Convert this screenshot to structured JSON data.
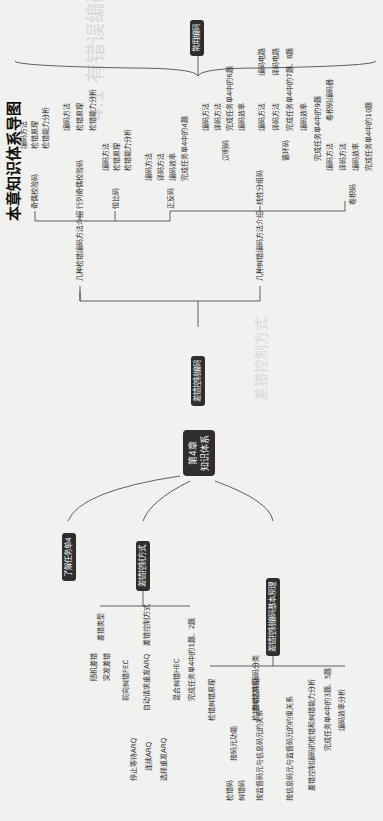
{
  "page": {
    "heading": "本章知识体系导图",
    "orientation": "rotated-90-ccw"
  },
  "mindmap": {
    "center": {
      "line1": "第4章",
      "line2": "知识体系"
    },
    "branches": [
      {
        "label": "了解任务单4"
      },
      {
        "label": "差错控制方式",
        "children": [
          {
            "label": "差错类型",
            "children": [
              {
                "label": "随机差错"
              },
              {
                "label": "突发差错"
              }
            ]
          },
          {
            "label": "差错控制方式",
            "children": [
              {
                "label": "前向纠错FEC"
              },
              {
                "label": "自动请求重发ARQ",
                "children": [
                  {
                    "label": "停止等待ARQ"
                  },
                  {
                    "label": "连续ARQ"
                  },
                  {
                    "label": "选择重发ARQ"
                  }
                ]
              },
              {
                "label": "混合纠错HEC"
              }
            ]
          },
          {
            "label": "完成任务单4中的1题、2题"
          }
        ]
      },
      {
        "label": "差错控制编码基本原理",
        "children": [
          {
            "label": "检错纠错原理"
          },
          {
            "label": "差错控制编码分类",
            "children": [
              {
                "label": "按码元功能",
                "children": [
                  {
                    "label": "检错码"
                  },
                  {
                    "label": "纠错码"
                  }
                ]
              },
              {
                "label": "按监督码元与信息码元的关系",
                "children": [
                  {
                    "label": "线性码"
                  },
                  {
                    "label": "非线性码"
                  }
                ]
              },
              {
                "label": "按信息码元与监督码元的约束关系",
                "children": [
                  {
                    "label": "分组码"
                  },
                  {
                    "label": "卷积码"
                  }
                ]
              }
            ]
          },
          {
            "label": "差错控制编码的检错和纠错能力分析"
          },
          {
            "label": "完成任务单4中的3题、5题"
          },
          {
            "label": "编码效率分析"
          }
        ]
      },
      {
        "label": "差错控制编码",
        "children": [
          {
            "label": "几种检错编码方法介绍",
            "children": [
              {
                "label": "奇偶校验码",
                "children": [
                  {
                    "label": "编码方法"
                  },
                  {
                    "label": "检错原理"
                  },
                  {
                    "label": "检错能力分析"
                  }
                ]
              },
              {
                "label": "行列奇偶校验码",
                "children": [
                  {
                    "label": "编码方法"
                  },
                  {
                    "label": "检错原理"
                  },
                  {
                    "label": "检错能力分析"
                  }
                ]
              },
              {
                "label": "恒比码",
                "children": [
                  {
                    "label": "编码方法"
                  },
                  {
                    "label": "检错原理"
                  },
                  {
                    "label": "检错能力分析"
                  }
                ]
              },
              {
                "label": "正反码",
                "children": [
                  {
                    "label": "编码方法"
                  },
                  {
                    "label": "译码方法"
                  },
                  {
                    "label": "编码效率"
                  },
                  {
                    "label": "完成任务单4中的4题"
                  }
                ]
              }
            ]
          },
          {
            "label": "几种纠错编码方法介绍",
            "children": [
              {
                "label": "线性分组码",
                "children": [
                  {
                    "label": "汉明码",
                    "children": [
                      {
                        "label": "编码方法"
                      },
                      {
                        "label": "译码方法"
                      },
                      {
                        "label": "完成任务单4中的6题"
                      },
                      {
                        "label": "编码效率"
                      }
                    ]
                  },
                  {
                    "label": "循环码",
                    "children": [
                      {
                        "label": "编码方法",
                        "detail": "编码电路"
                      },
                      {
                        "label": "译码方法",
                        "detail": "译码电路"
                      },
                      {
                        "label": "完成任务单4中的7题、8题"
                      },
                      {
                        "label": "编码效率"
                      }
                    ]
                  },
                  {
                    "label": "完成任务单4中的9题"
                  }
                ]
              },
              {
                "label": "卷积码",
                "children": [
                  {
                    "label": "编码方法",
                    "detail": "卷积码编码器"
                  },
                  {
                    "label": "译码方法"
                  },
                  {
                    "label": "编码效率"
                  },
                  {
                    "label": "完成任务单4中的10题"
                  }
                ]
              }
            ]
          }
        ]
      }
    ],
    "root_top": "常用编码"
  },
  "background_text": [
    "4.1 有错误编码",
    "差错控制方式"
  ],
  "colors": {
    "background": "#f1f1ef",
    "node_fill": "#2e2e2e",
    "node_text": "#f4f4f4",
    "line": "#3a3a3a",
    "text": "#2a2a2a"
  }
}
